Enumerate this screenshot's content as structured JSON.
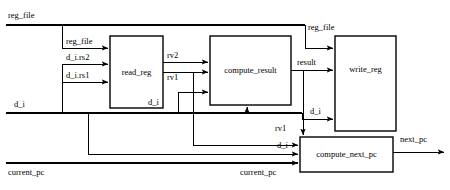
{
  "diagram": {
    "stroke_color": "#000000",
    "background_color": "#ffffff",
    "blocks": [
      {
        "id": "read_reg",
        "label": "read_reg",
        "x": 110,
        "y": 36,
        "w": 53,
        "h": 72
      },
      {
        "id": "compute_result",
        "label": "compute_result",
        "x": 210,
        "y": 36,
        "w": 81,
        "h": 69
      },
      {
        "id": "write_reg",
        "label": "write_reg",
        "x": 335,
        "y": 36,
        "w": 61,
        "h": 95
      },
      {
        "id": "compute_next_pc",
        "label": "compute_next_pc",
        "x": 300,
        "y": 137,
        "w": 93,
        "h": 35
      }
    ],
    "signals": [
      {
        "id": "reg_file_in",
        "label": "reg_file",
        "x": 8,
        "y": 18,
        "align": "start"
      },
      {
        "id": "reg_file_to_read",
        "label": "reg_file",
        "x": 66,
        "y": 44,
        "align": "start"
      },
      {
        "id": "d_i_rs2",
        "label": "d_i.rs2",
        "x": 66,
        "y": 60,
        "align": "start"
      },
      {
        "id": "d_i_rs1",
        "label": "d_i.rs1",
        "x": 66,
        "y": 78,
        "align": "start"
      },
      {
        "id": "d_i_in",
        "label": "d_i",
        "x": 14,
        "y": 107,
        "align": "start"
      },
      {
        "id": "rv2",
        "label": "rv2",
        "x": 167,
        "y": 58,
        "align": "start"
      },
      {
        "id": "rv1",
        "label": "rv1",
        "x": 167,
        "y": 80,
        "align": "start"
      },
      {
        "id": "d_i_to_compute",
        "label": "d_i",
        "x": 148,
        "y": 105,
        "align": "start"
      },
      {
        "id": "reg_file_to_write",
        "label": "reg_file",
        "x": 308,
        "y": 30,
        "align": "start"
      },
      {
        "id": "result",
        "label": "result",
        "x": 297,
        "y": 65,
        "align": "start"
      },
      {
        "id": "d_i_to_write",
        "label": "d_i",
        "x": 310,
        "y": 114,
        "align": "start"
      },
      {
        "id": "rv1_to_next_pc",
        "label": "rv1",
        "x": 275,
        "y": 131,
        "align": "start"
      },
      {
        "id": "d_i_to_next_pc",
        "label": "d_i",
        "x": 277,
        "y": 148,
        "align": "start"
      },
      {
        "id": "current_pc_to_next",
        "label": "current_pc",
        "x": 240,
        "y": 175,
        "align": "start"
      },
      {
        "id": "current_pc_in",
        "label": "current_pc",
        "x": 8,
        "y": 175,
        "align": "start"
      },
      {
        "id": "next_pc_out",
        "label": "next_pc",
        "x": 400,
        "y": 142,
        "align": "start"
      }
    ]
  }
}
